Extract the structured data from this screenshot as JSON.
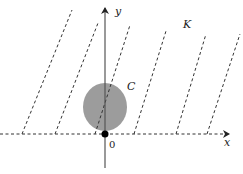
{
  "diagram": {
    "labels": {
      "x_axis": "x",
      "y_axis": "y",
      "origin": "0",
      "set_c": "C",
      "cone_k": "K"
    },
    "colors": {
      "axis": "#333333",
      "dashed_lines": "#333333",
      "circle_fill": "#9c9c9c",
      "origin_dot": "#000000"
    },
    "dashed_lines": [
      {
        "x1": 22,
        "y1": 134,
        "x2": 72,
        "y2": 10
      },
      {
        "x1": 55,
        "y1": 134,
        "x2": 98,
        "y2": 23
      },
      {
        "x1": 95,
        "y1": 134,
        "x2": 130,
        "y2": 25
      },
      {
        "x1": 134,
        "y1": 134,
        "x2": 166,
        "y2": 31
      },
      {
        "x1": 176,
        "y1": 134,
        "x2": 206,
        "y2": 34
      },
      {
        "x1": 207,
        "y1": 134,
        "x2": 240,
        "y2": 34
      }
    ]
  }
}
